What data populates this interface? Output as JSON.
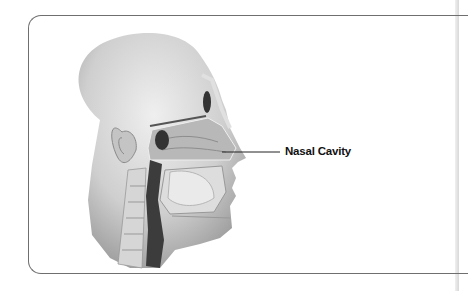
{
  "diagram": {
    "labels": [
      {
        "text": "Nasal Cavity",
        "target": "nasal-cavity"
      }
    ]
  },
  "colors": {
    "frame_border": "#6f6f6f",
    "background": "#ffffff",
    "label_text": "#111111",
    "leader_line": "#222222"
  }
}
